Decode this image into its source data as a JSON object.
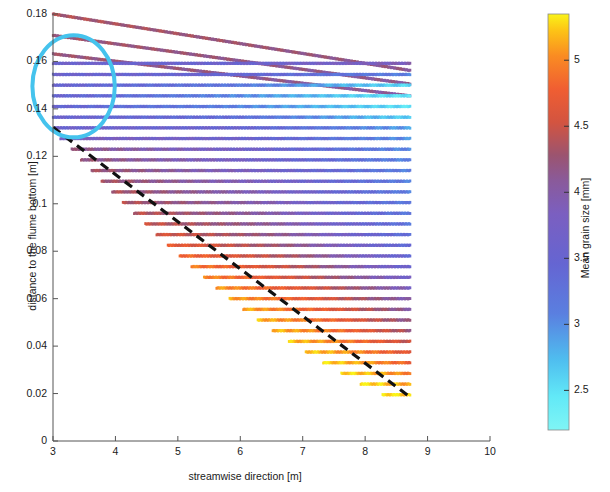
{
  "figure": {
    "type": "scatter",
    "background": "#ffffff"
  },
  "axes": {
    "x": {
      "label": "streamwise direction [m]",
      "ticks": [
        "3",
        "4",
        "5",
        "6",
        "7",
        "8",
        "9",
        "10"
      ],
      "tick_values": [
        3,
        4,
        5,
        6,
        7,
        8,
        9,
        10
      ],
      "lim": [
        3,
        10
      ]
    },
    "y": {
      "label": "distance to the flume bottom [m]",
      "ticks": [
        "0",
        "0.02",
        "0.04",
        "0.06",
        "0.08",
        "0.1",
        "0.12",
        "0.14",
        "0.16",
        "0.18"
      ],
      "tick_values": [
        0,
        0.02,
        0.04,
        0.06,
        0.08,
        0.1,
        0.12,
        0.14,
        0.16,
        0.18
      ],
      "lim": [
        0,
        0.18
      ]
    }
  },
  "colorbar": {
    "label": "Mean grain size [mm]",
    "ticks": [
      "2.5",
      "3",
      "3.5",
      "4",
      "4.5",
      "5"
    ],
    "tick_values": [
      2.5,
      3,
      3.5,
      4,
      4.5,
      5
    ],
    "lim": [
      2.2,
      5.35
    ],
    "stops": [
      {
        "pos": 0.0,
        "color": "#7FF5F5"
      },
      {
        "pos": 0.08,
        "color": "#62E9F7"
      },
      {
        "pos": 0.17,
        "color": "#4FBDEF"
      },
      {
        "pos": 0.28,
        "color": "#5A7FE0"
      },
      {
        "pos": 0.4,
        "color": "#6565D2"
      },
      {
        "pos": 0.52,
        "color": "#7B5FC0"
      },
      {
        "pos": 0.6,
        "color": "#8A5A9A"
      },
      {
        "pos": 0.66,
        "color": "#9B5470"
      },
      {
        "pos": 0.74,
        "color": "#D35440"
      },
      {
        "pos": 0.82,
        "color": "#F05E32"
      },
      {
        "pos": 0.9,
        "color": "#FA8C22"
      },
      {
        "pos": 0.96,
        "color": "#FDC316"
      },
      {
        "pos": 1.0,
        "color": "#FAF318"
      }
    ]
  },
  "annotations": {
    "circle": {
      "name": "highlight-circle",
      "color": "#45C3ED",
      "cx": 3.33,
      "cy": 0.1495,
      "rx": 0.66,
      "ry": 0.0215,
      "stroke_width": 4
    },
    "bed_slope_line": {
      "name": "bed-slope-dashed-line",
      "color": "#111111",
      "x0": 3.0,
      "y0": 0.1322,
      "x1": 8.72,
      "y1": 0.0185,
      "dash": "9 6",
      "stroke_width": 3.2
    }
  },
  "chart_data": {
    "type": "scatter",
    "title": "",
    "xlabel": "streamwise direction [m]",
    "ylabel": "distance to the flume bottom [m]",
    "clabel": "Mean grain size [mm]",
    "xlim": [
      3,
      10
    ],
    "ylim": [
      0,
      0.18
    ],
    "clim": [
      2.2,
      5.35
    ],
    "grid": false,
    "legend": "none",
    "x_start_default": 3.0,
    "x_end_default": 8.72,
    "rows": [
      {
        "y": 0.18,
        "x0": 3.0,
        "x1": 8.72,
        "y_end": 0.1562,
        "sloped": true,
        "c0": 4.35,
        "c1": 4.15,
        "cmid": 4.25
      },
      {
        "y": 0.171,
        "x0": 3.0,
        "x1": 8.72,
        "y_end": 0.1505,
        "sloped": true,
        "c0": 4.3,
        "c1": 4.1,
        "cmid": 4.2
      },
      {
        "y": 0.1632,
        "x0": 3.0,
        "x1": 8.72,
        "y_end": 0.1455,
        "sloped": true,
        "c0": 4.25,
        "c1": 4.05,
        "cmid": 4.18
      },
      {
        "y": 0.1592,
        "x0": 3.0,
        "x1": 8.72,
        "sloped": false,
        "c0": 3.62,
        "cmid": 3.55,
        "c1": 3.9
      },
      {
        "y": 0.1545,
        "x0": 3.0,
        "x1": 8.72,
        "sloped": false,
        "c0": 3.58,
        "cmid": 3.5,
        "c1": 3.1
      },
      {
        "y": 0.15,
        "x0": 3.0,
        "x1": 8.72,
        "sloped": false,
        "c0": 3.55,
        "cmid": 3.2,
        "c1": 2.55
      },
      {
        "y": 0.1455,
        "x0": 3.0,
        "x1": 8.72,
        "sloped": false,
        "c0": 3.52,
        "cmid": 3.05,
        "c1": 2.45
      },
      {
        "y": 0.141,
        "x0": 3.0,
        "x1": 8.72,
        "sloped": false,
        "c0": 3.5,
        "cmid": 3.1,
        "c1": 2.5
      },
      {
        "y": 0.1365,
        "x0": 3.0,
        "x1": 8.72,
        "sloped": false,
        "c0": 3.55,
        "cmid": 3.35,
        "c1": 2.62
      },
      {
        "y": 0.132,
        "x0": 3.03,
        "x1": 8.72,
        "sloped": false,
        "c0": 3.6,
        "cmid": 3.55,
        "c1": 2.9
      },
      {
        "y": 0.1275,
        "x0": 3.12,
        "x1": 8.72,
        "sloped": false,
        "c0": 3.85,
        "cmid": 3.62,
        "c1": 2.98
      },
      {
        "y": 0.123,
        "x0": 3.3,
        "x1": 8.72,
        "sloped": false,
        "c0": 4.18,
        "cmid": 3.7,
        "c1": 3.02
      },
      {
        "y": 0.1185,
        "x0": 3.45,
        "x1": 8.72,
        "sloped": false,
        "c0": 4.25,
        "cmid": 3.72,
        "c1": 3.05
      },
      {
        "y": 0.114,
        "x0": 3.62,
        "x1": 8.72,
        "sloped": false,
        "c0": 4.3,
        "cmid": 3.8,
        "c1": 3.08
      },
      {
        "y": 0.1095,
        "x0": 3.78,
        "x1": 8.72,
        "sloped": false,
        "c0": 4.32,
        "cmid": 3.85,
        "c1": 3.1
      },
      {
        "y": 0.105,
        "x0": 3.95,
        "x1": 8.72,
        "sloped": false,
        "c0": 4.35,
        "cmid": 3.9,
        "c1": 3.12
      },
      {
        "y": 0.1005,
        "x0": 4.12,
        "x1": 8.72,
        "sloped": false,
        "c0": 4.38,
        "cmid": 3.95,
        "c1": 3.15
      },
      {
        "y": 0.096,
        "x0": 4.3,
        "x1": 8.72,
        "sloped": false,
        "c0": 4.42,
        "cmid": 4.0,
        "c1": 3.18
      },
      {
        "y": 0.0915,
        "x0": 4.48,
        "x1": 8.72,
        "sloped": false,
        "c0": 4.48,
        "cmid": 4.05,
        "c1": 3.22
      },
      {
        "y": 0.087,
        "x0": 4.66,
        "x1": 8.72,
        "sloped": false,
        "c0": 4.58,
        "cmid": 4.12,
        "c1": 3.28
      },
      {
        "y": 0.0825,
        "x0": 4.84,
        "x1": 8.72,
        "sloped": false,
        "c0": 4.72,
        "cmid": 4.2,
        "c1": 3.35
      },
      {
        "y": 0.078,
        "x0": 5.03,
        "x1": 8.72,
        "sloped": false,
        "c0": 4.85,
        "cmid": 4.3,
        "c1": 3.45
      },
      {
        "y": 0.0735,
        "x0": 5.22,
        "x1": 8.72,
        "sloped": false,
        "c0": 4.95,
        "cmid": 4.38,
        "c1": 3.55
      },
      {
        "y": 0.069,
        "x0": 5.42,
        "x1": 8.72,
        "sloped": false,
        "c0": 5.02,
        "cmid": 4.45,
        "c1": 3.7
      },
      {
        "y": 0.0645,
        "x0": 5.62,
        "x1": 8.72,
        "sloped": false,
        "c0": 5.08,
        "cmid": 4.55,
        "c1": 3.85
      },
      {
        "y": 0.06,
        "x0": 5.83,
        "x1": 8.72,
        "sloped": false,
        "c0": 5.12,
        "cmid": 4.62,
        "c1": 3.95
      },
      {
        "y": 0.0555,
        "x0": 6.05,
        "x1": 8.72,
        "sloped": false,
        "c0": 5.15,
        "cmid": 4.7,
        "c1": 4.05
      },
      {
        "y": 0.051,
        "x0": 6.28,
        "x1": 8.72,
        "sloped": false,
        "c0": 5.18,
        "cmid": 4.78,
        "c1": 4.15
      },
      {
        "y": 0.0465,
        "x0": 6.52,
        "x1": 8.72,
        "sloped": false,
        "c0": 5.2,
        "cmid": 4.85,
        "c1": 4.28
      },
      {
        "y": 0.042,
        "x0": 6.78,
        "x1": 8.72,
        "sloped": false,
        "c0": 5.22,
        "cmid": 4.92,
        "c1": 4.45
      },
      {
        "y": 0.0375,
        "x0": 7.05,
        "x1": 8.72,
        "sloped": false,
        "c0": 5.25,
        "cmid": 5.0,
        "c1": 4.62
      },
      {
        "y": 0.033,
        "x0": 7.33,
        "x1": 8.72,
        "sloped": false,
        "c0": 5.28,
        "cmid": 5.08,
        "c1": 4.78
      },
      {
        "y": 0.0285,
        "x0": 7.62,
        "x1": 8.72,
        "sloped": false,
        "c0": 5.3,
        "cmid": 5.15,
        "c1": 4.95
      },
      {
        "y": 0.024,
        "x0": 7.93,
        "x1": 8.72,
        "sloped": false,
        "c0": 5.32,
        "cmid": 5.22,
        "c1": 5.1
      },
      {
        "y": 0.0195,
        "x0": 8.28,
        "x1": 8.72,
        "sloped": false,
        "c0": 5.34,
        "cmid": 5.3,
        "c1": 5.22
      }
    ]
  }
}
